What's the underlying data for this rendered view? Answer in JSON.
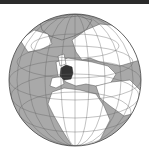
{
  "map": {
    "type": "orthographic-locator",
    "highlighted_region": "France",
    "colors": {
      "ocean": "#a9a9a9",
      "land": "#ffffff",
      "highlight": "#333333",
      "border": "#555555",
      "graticule": "#666666",
      "topbar": "#2b2b2b"
    }
  }
}
